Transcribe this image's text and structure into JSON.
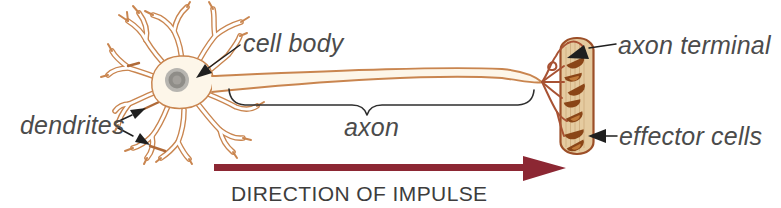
{
  "labels": {
    "dendrites": "dendrites",
    "cell_body": "cell body",
    "axon": "axon",
    "axon_terminal": "axon terminal",
    "effector_cells": "effector cells",
    "direction_of_impulse": "DIRECTION OF IMPULSE"
  },
  "graphics": {
    "leader_arrows": [
      "dendrites-upper-arrow",
      "dendrites-lower-arrow",
      "cell-body-arrow",
      "axon-terminal-arrow",
      "effector-cells-arrow"
    ],
    "brace": "axon-extent-brace",
    "impulse_arrow": "right-pointing-arrow"
  },
  "colors": {
    "neuron_outline": "#c9854f",
    "dark_twig": "#b06a38",
    "soma_fill": "#fdf6e9",
    "nucleus_outer": "#b7b5b0",
    "nucleus_mid": "#8f8d88",
    "nucleus_inner": "#a3a09b",
    "terminal_branch": "#a85233",
    "effector_fill": "#e5cba0",
    "effector_border": "#9c4f28",
    "effector_stripe": "#d2b183",
    "bouton": "#8a4517",
    "bouton_light": "#c07a3a",
    "impulse_arrow": "#8c2733",
    "leader": "#1f1f1f",
    "brace": "#2e2e2e",
    "label_text": "#4b4b4b",
    "direction_text": "#3d3d3d"
  }
}
